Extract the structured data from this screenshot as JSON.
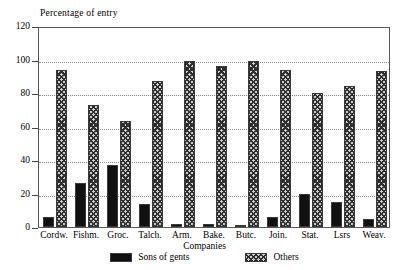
{
  "chart_data": {
    "type": "bar",
    "title": "",
    "ylabel": "Percentage of entry",
    "xlabel": "Companies",
    "ylim": [
      0,
      120
    ],
    "yticks": [
      0,
      20,
      40,
      60,
      80,
      100,
      120
    ],
    "grid": true,
    "legend_position": "bottom",
    "categories": [
      "Cordw.",
      "Fishm.",
      "Groc.",
      "Talch.",
      "Arm.",
      "Bake.",
      "Butc.",
      "Join.",
      "Stat.",
      "Lsrs",
      "Weav."
    ],
    "series": [
      {
        "name": "Sons of gents",
        "color": "#111111",
        "values": [
          6,
          26,
          37,
          14,
          2,
          2,
          1,
          6,
          20,
          15,
          5
        ]
      },
      {
        "name": "Others",
        "color": "#cfcfcf",
        "values": [
          94,
          73,
          63,
          87,
          99,
          96,
          99,
          94,
          80,
          84,
          93
        ]
      }
    ]
  }
}
